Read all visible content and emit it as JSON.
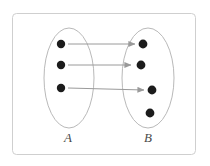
{
  "figure": {
    "kind": "mapping-diagram",
    "title": "",
    "frame": {
      "stroke_color": "#cfcfcf",
      "fill_color": "#ffffff",
      "x": 12,
      "y": 13,
      "width": 184,
      "height": 142,
      "corner_radius": 4
    },
    "sets": [
      {
        "id": "A",
        "label": "A",
        "label_x": 68,
        "label_y": 142,
        "ellipse": {
          "cx": 69,
          "cy": 78,
          "rx": 25,
          "ry": 50
        },
        "stroke_color": "#b9b9b9",
        "elements": [
          {
            "id": "a1",
            "cx": 61,
            "cy": 44,
            "r": 4.2
          },
          {
            "id": "a2",
            "cx": 61,
            "cy": 65,
            "r": 4.2
          },
          {
            "id": "a3",
            "cx": 61,
            "cy": 88,
            "r": 4.2
          }
        ]
      },
      {
        "id": "B",
        "label": "B",
        "label_x": 148,
        "label_y": 142,
        "ellipse": {
          "cx": 148,
          "cy": 78,
          "rx": 26,
          "ry": 50
        },
        "stroke_color": "#b9b9b9",
        "elements": [
          {
            "id": "b1",
            "cx": 143,
            "cy": 44,
            "r": 4.4
          },
          {
            "id": "b2",
            "cx": 141,
            "cy": 65,
            "r": 4.4
          },
          {
            "id": "b3",
            "cx": 152,
            "cy": 90,
            "r": 4.4
          },
          {
            "id": "b4",
            "cx": 150,
            "cy": 113,
            "r": 4.4
          }
        ]
      }
    ],
    "dot_color": "#1c1c1c",
    "arrow_color": "#9a9a9a",
    "arrows": [
      {
        "id": "arrow-a1-b1",
        "from": "a1",
        "to": "b1",
        "x1": 68,
        "y1": 44,
        "x2": 135,
        "y2": 44
      },
      {
        "id": "arrow-a2-b2",
        "from": "a2",
        "to": "b2",
        "x1": 68,
        "y1": 65,
        "x2": 131,
        "y2": 65
      },
      {
        "id": "arrow-a3-b3",
        "from": "a3",
        "to": "b3",
        "x1": 68,
        "y1": 88,
        "x2": 144,
        "y2": 90
      }
    ]
  }
}
